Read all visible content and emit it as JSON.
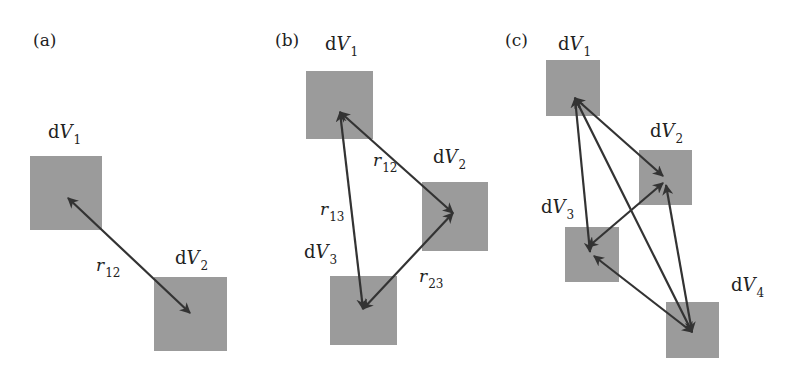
{
  "figure": {
    "panels": [
      {
        "id": "a",
        "label": "(a)",
        "volumes": [
          {
            "name": "dV1",
            "prefix": "d",
            "symbol": "V",
            "sub": "1"
          },
          {
            "name": "dV2",
            "prefix": "d",
            "symbol": "V",
            "sub": "2"
          }
        ],
        "distances": [
          {
            "name": "r12",
            "symbol": "r",
            "sub": "12",
            "between": [
              "dV1",
              "dV2"
            ]
          }
        ]
      },
      {
        "id": "b",
        "label": "(b)",
        "volumes": [
          {
            "name": "dV1",
            "prefix": "d",
            "symbol": "V",
            "sub": "1"
          },
          {
            "name": "dV2",
            "prefix": "d",
            "symbol": "V",
            "sub": "2"
          },
          {
            "name": "dV3",
            "prefix": "d",
            "symbol": "V",
            "sub": "3"
          }
        ],
        "distances": [
          {
            "name": "r12",
            "symbol": "r",
            "sub": "12",
            "between": [
              "dV1",
              "dV2"
            ]
          },
          {
            "name": "r13",
            "symbol": "r",
            "sub": "13",
            "between": [
              "dV1",
              "dV3"
            ]
          },
          {
            "name": "r23",
            "symbol": "r",
            "sub": "23",
            "between": [
              "dV2",
              "dV3"
            ]
          }
        ]
      },
      {
        "id": "c",
        "label": "(c)",
        "volumes": [
          {
            "name": "dV1",
            "prefix": "d",
            "symbol": "V",
            "sub": "1"
          },
          {
            "name": "dV2",
            "prefix": "d",
            "symbol": "V",
            "sub": "2"
          },
          {
            "name": "dV3",
            "prefix": "d",
            "symbol": "V",
            "sub": "3"
          },
          {
            "name": "dV4",
            "prefix": "d",
            "symbol": "V",
            "sub": "4"
          }
        ],
        "distances": [
          {
            "between": [
              "dV1",
              "dV2"
            ]
          },
          {
            "between": [
              "dV1",
              "dV3"
            ]
          },
          {
            "between": [
              "dV1",
              "dV4"
            ]
          },
          {
            "between": [
              "dV2",
              "dV3"
            ]
          },
          {
            "between": [
              "dV2",
              "dV4"
            ]
          },
          {
            "between": [
              "dV3",
              "dV4"
            ]
          }
        ]
      }
    ],
    "colors": {
      "volume_fill": "#9b9b9b",
      "arrow": "#333333",
      "text": "#222222",
      "background": "#ffffff"
    }
  }
}
